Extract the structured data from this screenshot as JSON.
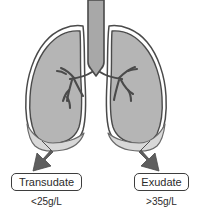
{
  "figure": {
    "name": "pleural-effusion-lungs-diagram",
    "background_color": "#ffffff",
    "width": 198,
    "height": 217
  },
  "anatomy": {
    "trachea": {
      "name": "trachea",
      "fill_color": "#a8a8a8",
      "outline_color": "#4a4a4a"
    },
    "bronchi": {
      "name": "bronchial-tree",
      "outline_color": "#4a4a4a"
    },
    "lungs": {
      "name": "lungs",
      "fill_color": "#b5b5b5",
      "outline_color": "#4a4a4a",
      "pleura_color": "#ffffff"
    },
    "effusion": {
      "name": "pleural-effusion",
      "fill_color": "#d8d8d8",
      "outline_color": "#6a6a6a"
    }
  },
  "arrows": {
    "color": "#5e5e5e",
    "left": {
      "name": "arrow-to-transudate"
    },
    "right": {
      "name": "arrow-to-exudate"
    }
  },
  "labels": {
    "left": {
      "title": "Transudate",
      "value": "<25g/L"
    },
    "right": {
      "title": "Exudate",
      "value": ">35g/L"
    }
  }
}
